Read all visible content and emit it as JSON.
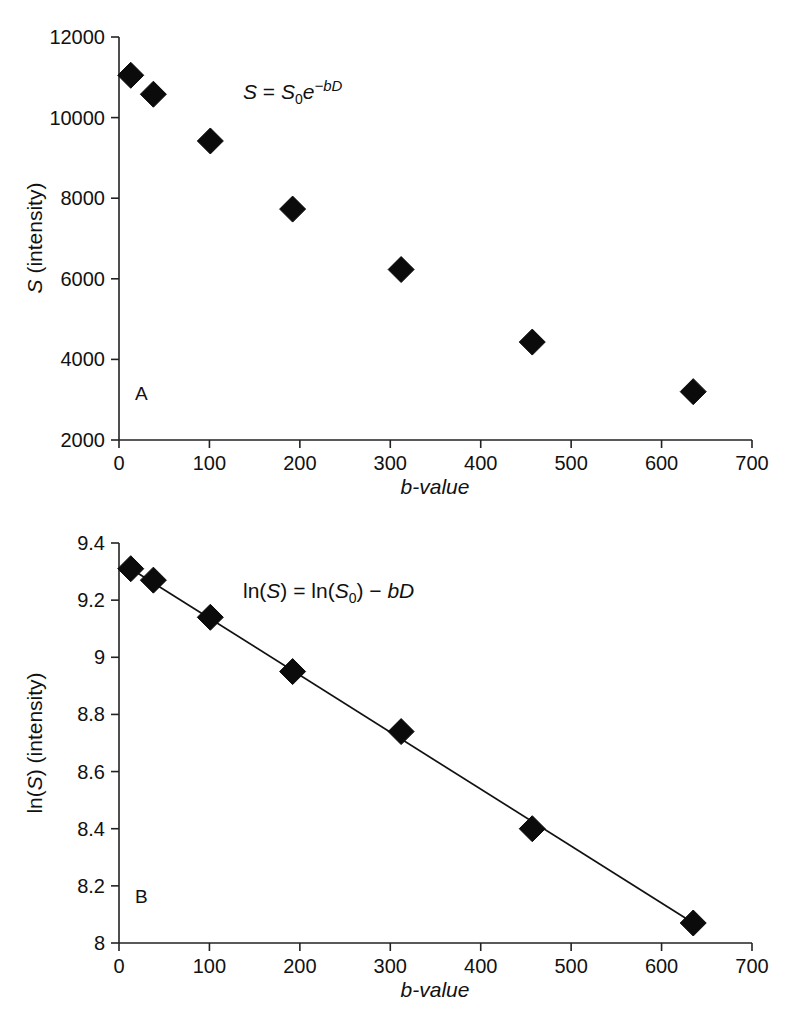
{
  "figure": {
    "background_color": "#ffffff",
    "marker_color": "#0b0b0b",
    "axis_color": "#222222",
    "line_color": "#111111"
  },
  "panel_a": {
    "letter": "A",
    "equation": "S = S₀e⁻ᵇᴰ",
    "equation_parts": {
      "lhs": "S",
      "eq": "=",
      "s0": "S",
      "sub": "0",
      "e": "e",
      "exponent": "−bD"
    },
    "xlabel_italic": "b-value",
    "ylabel_prefix_italic": "S",
    "ylabel_suffix": " (intensity)",
    "x_ticks": [
      "0",
      "100",
      "200",
      "300",
      "400",
      "500",
      "600",
      "700"
    ],
    "y_ticks": [
      "2000",
      "4000",
      "6000",
      "8000",
      "10000",
      "12000"
    ]
  },
  "panel_b": {
    "letter": "B",
    "equation": "ln(S) = ln(S₀) − bD",
    "equation_parts": {
      "ln1": "ln(",
      "s1": "S",
      "close1": ") = ln(",
      "s2": "S",
      "sub": "0",
      "close2": ") − ",
      "bd": "bD"
    },
    "xlabel_italic": "b-value",
    "ylabel_prefix": "ln(",
    "ylabel_italic": "S",
    "ylabel_suffix": ") (intensity)",
    "x_ticks": [
      "0",
      "100",
      "200",
      "300",
      "400",
      "500",
      "600",
      "700"
    ],
    "y_ticks": [
      "8",
      "8.2",
      "8.4",
      "8.6",
      "8.8",
      "9",
      "9.2",
      "9.4"
    ]
  },
  "chart_data": [
    {
      "type": "scatter",
      "panel": "A",
      "title": "",
      "annotation": "S = S₀e⁻ᵇᴰ",
      "xlabel": "b-value",
      "ylabel": "S (intensity)",
      "xlim": [
        0,
        700
      ],
      "ylim": [
        2000,
        12000
      ],
      "xticks": [
        0,
        100,
        200,
        300,
        400,
        500,
        600,
        700
      ],
      "yticks": [
        2000,
        4000,
        6000,
        8000,
        10000,
        12000
      ],
      "grid": false,
      "legend": "none",
      "marker": "diamond",
      "x": [
        13,
        38,
        101,
        192,
        312,
        457,
        635
      ],
      "y": [
        11050,
        10580,
        9420,
        7730,
        6230,
        4430,
        3200
      ]
    },
    {
      "type": "scatter",
      "panel": "B",
      "title": "",
      "annotation": "ln(S) = ln(S₀) − bD",
      "xlabel": "b-value",
      "ylabel": "ln(S) (intensity)",
      "xlim": [
        0,
        700
      ],
      "ylim": [
        8,
        9.4
      ],
      "xticks": [
        0,
        100,
        200,
        300,
        400,
        500,
        600,
        700
      ],
      "yticks": [
        8,
        8.2,
        8.4,
        8.6,
        8.8,
        9,
        9.2,
        9.4
      ],
      "grid": false,
      "legend": "none",
      "marker": "diamond",
      "has_fit_line": true,
      "x": [
        13,
        38,
        101,
        192,
        312,
        457,
        635
      ],
      "y": [
        9.31,
        9.27,
        9.14,
        8.95,
        8.74,
        8.4,
        8.07
      ],
      "fit_line": {
        "x": [
          13,
          635
        ],
        "y": [
          9.31,
          8.07
        ]
      }
    }
  ]
}
